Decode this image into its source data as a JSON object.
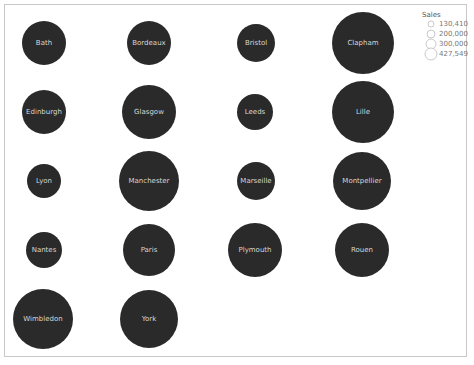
{
  "chart_data": {
    "type": "bubble",
    "title": "",
    "size_measure": "Sales",
    "layout": "grid 4 columns",
    "bubble_color": "#2a2a2a",
    "label_color": "#d6d6d6",
    "points": [
      {
        "label": "Bath",
        "row": 0,
        "col": 0,
        "cx": 44,
        "cy": 43,
        "r": 22
      },
      {
        "label": "Bordeaux",
        "row": 0,
        "col": 1,
        "cx": 149,
        "cy": 43,
        "r": 22
      },
      {
        "label": "Bristol",
        "row": 0,
        "col": 2,
        "cx": 256,
        "cy": 43,
        "r": 19
      },
      {
        "label": "Clapham",
        "row": 0,
        "col": 3,
        "cx": 363,
        "cy": 43,
        "r": 31
      },
      {
        "label": "Edinburgh",
        "row": 1,
        "col": 0,
        "cx": 44,
        "cy": 112,
        "r": 22
      },
      {
        "label": "Glasgow",
        "row": 1,
        "col": 1,
        "cx": 149,
        "cy": 112,
        "r": 27
      },
      {
        "label": "Leeds",
        "row": 1,
        "col": 2,
        "cx": 255,
        "cy": 112,
        "r": 18
      },
      {
        "label": "Lille",
        "row": 1,
        "col": 3,
        "cx": 363,
        "cy": 112,
        "r": 31
      },
      {
        "label": "Lyon",
        "row": 2,
        "col": 0,
        "cx": 44,
        "cy": 181,
        "r": 17
      },
      {
        "label": "Manchester",
        "row": 2,
        "col": 1,
        "cx": 149,
        "cy": 181,
        "r": 30
      },
      {
        "label": "Marseille",
        "row": 2,
        "col": 2,
        "cx": 256,
        "cy": 181,
        "r": 19
      },
      {
        "label": "Montpellier",
        "row": 2,
        "col": 3,
        "cx": 362,
        "cy": 181,
        "r": 29
      },
      {
        "label": "Nantes",
        "row": 3,
        "col": 0,
        "cx": 44,
        "cy": 250,
        "r": 18
      },
      {
        "label": "Paris",
        "row": 3,
        "col": 1,
        "cx": 149,
        "cy": 250,
        "r": 26
      },
      {
        "label": "Plymouth",
        "row": 3,
        "col": 2,
        "cx": 255,
        "cy": 250,
        "r": 27
      },
      {
        "label": "Rouen",
        "row": 3,
        "col": 3,
        "cx": 362,
        "cy": 250,
        "r": 27
      },
      {
        "label": "Wimbledon",
        "row": 4,
        "col": 0,
        "cx": 43,
        "cy": 319,
        "r": 30
      },
      {
        "label": "York",
        "row": 4,
        "col": 1,
        "cx": 149,
        "cy": 319,
        "r": 29
      }
    ],
    "legend": {
      "title": "Sales",
      "position": "top-right",
      "items": [
        {
          "label": "130,410",
          "r": 3
        },
        {
          "label": "200,000",
          "r": 4
        },
        {
          "label": "300,000",
          "r": 5
        },
        {
          "label": "427,549",
          "r": 6
        }
      ]
    }
  }
}
